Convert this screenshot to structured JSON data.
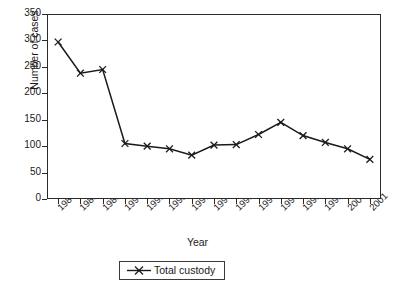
{
  "chart_data": {
    "type": "line",
    "title": "",
    "xlabel": "Year",
    "ylabel": "Number of cases",
    "categories": [
      "1987",
      "1988",
      "1989",
      "1990",
      "1991",
      "1992",
      "1993",
      "1994",
      "1995",
      "1996",
      "1997",
      "1998",
      "1999",
      "2000",
      "2001"
    ],
    "series": [
      {
        "name": "Total custody",
        "values": [
          297,
          238,
          245,
          105,
          100,
          95,
          83,
          102,
          103,
          122,
          145,
          120,
          107,
          95,
          75
        ]
      }
    ],
    "ylim": [
      0,
      350
    ],
    "yticks": [
      0,
      50,
      100,
      150,
      200,
      250,
      300,
      350
    ],
    "grid": false,
    "legend_position": "bottom-center",
    "marker": "x",
    "line_color": "#1a1a1a",
    "frame": true
  },
  "legend": {
    "entries": [
      {
        "label": "Total custody",
        "marker_icon": "x-marker-icon"
      }
    ]
  }
}
